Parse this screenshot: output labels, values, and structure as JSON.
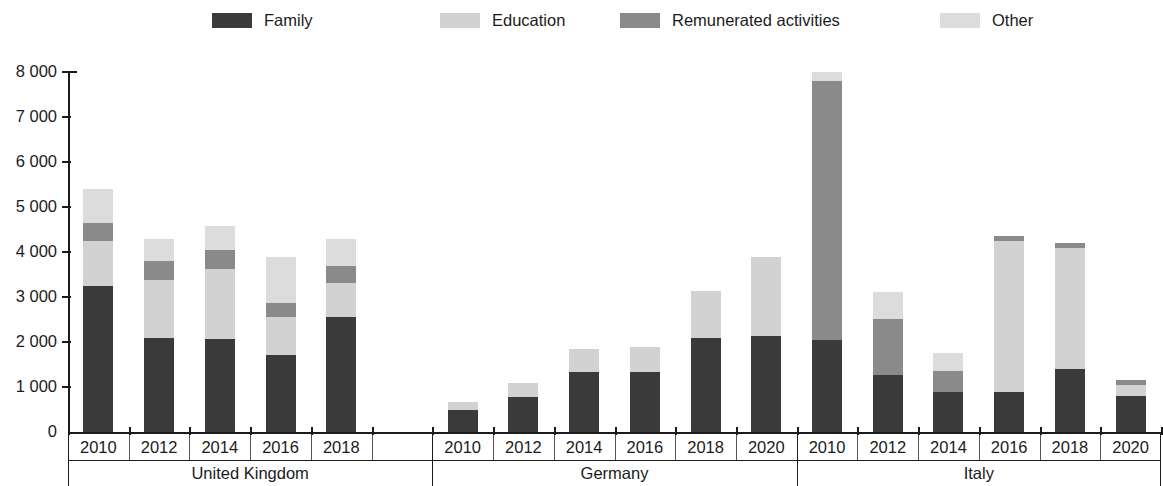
{
  "legend": {
    "items": [
      {
        "label": "Family",
        "color": "#3a3a3a",
        "x": 212
      },
      {
        "label": "Education",
        "color": "#d2d2d2",
        "x": 440
      },
      {
        "label": "Remunerated activities",
        "color": "#8a8a8a",
        "x": 620
      },
      {
        "label": "Other",
        "color": "#dcdcdc",
        "x": 940
      }
    ]
  },
  "axes": {
    "y_ticks": [
      "8 000",
      "7 000",
      "6 000",
      "5 000",
      "4 000",
      "3 000",
      "2 000",
      "1 000",
      "0"
    ],
    "y_min": 0,
    "y_max": 8000,
    "y_step": 1000
  },
  "chart_data": {
    "type": "bar",
    "stacked": true,
    "title": "",
    "xlabel": "",
    "ylabel": "",
    "ylim": [
      0,
      8000
    ],
    "ytick_step": 1000,
    "grid": false,
    "legend_position": "top",
    "series": [
      {
        "name": "Family",
        "color": "#3a3a3a"
      },
      {
        "name": "Education",
        "color": "#d2d2d2"
      },
      {
        "name": "Remunerated activities",
        "color": "#8a8a8a"
      },
      {
        "name": "Other",
        "color": "#dcdcdc"
      }
    ],
    "groups": [
      {
        "name": "United Kingdom",
        "categories": [
          "2010",
          "2012",
          "2014",
          "2016",
          "2018",
          ""
        ],
        "values": [
          {
            "Family": 3250,
            "Education": 1000,
            "Remunerated activities": 400,
            "Other": 750,
            "total": 5400
          },
          {
            "Family": 2080,
            "Education": 1300,
            "Remunerated activities": 430,
            "Other": 490,
            "total": 4300
          },
          {
            "Family": 2070,
            "Education": 1560,
            "Remunerated activities": 420,
            "Other": 530,
            "total": 4580
          },
          {
            "Family": 1720,
            "Education": 840,
            "Remunerated activities": 300,
            "Other": 1040,
            "total": 3900
          },
          {
            "Family": 2560,
            "Education": 750,
            "Remunerated activities": 390,
            "Other": 600,
            "total": 4300
          },
          {
            "Family": 0,
            "Education": 0,
            "Remunerated activities": 0,
            "Other": 0,
            "total": 0
          }
        ]
      },
      {
        "name": "Germany",
        "categories": [
          "2010",
          "2012",
          "2014",
          "2016",
          "2018",
          "2020"
        ],
        "values": [
          {
            "Family": 500,
            "Education": 170,
            "Remunerated activities": 0,
            "Other": 0,
            "total": 670
          },
          {
            "Family": 780,
            "Education": 320,
            "Remunerated activities": 0,
            "Other": 0,
            "total": 1100
          },
          {
            "Family": 1330,
            "Education": 520,
            "Remunerated activities": 0,
            "Other": 0,
            "total": 1850
          },
          {
            "Family": 1330,
            "Education": 550,
            "Remunerated activities": 0,
            "Other": 0,
            "total": 1880
          },
          {
            "Family": 2100,
            "Education": 1030,
            "Remunerated activities": 0,
            "Other": 0,
            "total": 3130
          },
          {
            "Family": 2130,
            "Education": 1770,
            "Remunerated activities": 0,
            "Other": 0,
            "total": 3900
          }
        ]
      },
      {
        "name": "Italy",
        "categories": [
          "2010",
          "2012",
          "2014",
          "2016",
          "2018",
          "2020"
        ],
        "values": [
          {
            "Family": 2050,
            "Education": 0,
            "Remunerated activities": 5750,
            "Other": 200,
            "total": 8000
          },
          {
            "Family": 1270,
            "Education": 0,
            "Remunerated activities": 1250,
            "Other": 600,
            "total": 3120
          },
          {
            "Family": 900,
            "Education": 0,
            "Remunerated activities": 450,
            "Other": 400,
            "total": 1750
          },
          {
            "Family": 900,
            "Education": 3350,
            "Remunerated activities": 100,
            "Other": 0,
            "total": 4350
          },
          {
            "Family": 1400,
            "Education": 2680,
            "Remunerated activities": 110,
            "Other": 0,
            "total": 4190
          },
          {
            "Family": 810,
            "Education": 240,
            "Remunerated activities": 110,
            "Other": 0,
            "total": 1160
          }
        ]
      }
    ]
  }
}
